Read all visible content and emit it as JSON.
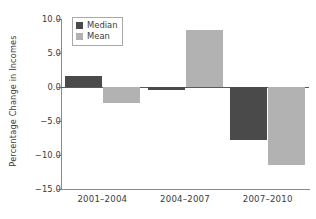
{
  "chart_data": {
    "type": "bar",
    "title": "",
    "xlabel": "",
    "ylabel": "Percentage Change in Incomes",
    "categories": [
      "2001–2004",
      "2004–2007",
      "2007–2010"
    ],
    "series": [
      {
        "name": "Median",
        "color": "#4a4a4a",
        "values": [
          1.6,
          -0.5,
          -7.8
        ]
      },
      {
        "name": "Mean",
        "color": "#b2b2b2",
        "values": [
          -2.3,
          8.4,
          -11.4
        ]
      }
    ],
    "ylim": [
      -15.0,
      10.0
    ],
    "ytick_values": [
      10.0,
      5.0,
      0.0,
      -5.0,
      -10.0,
      -15.0
    ],
    "ytick_labels": [
      "10.0",
      "5.0",
      "0.0",
      "−5.0",
      "−10.0",
      "−15.0"
    ],
    "grid": false,
    "legend_position": "upper left",
    "zero_line": true,
    "spines": [
      "left",
      "bottom"
    ],
    "background_color": "#ffffff"
  }
}
